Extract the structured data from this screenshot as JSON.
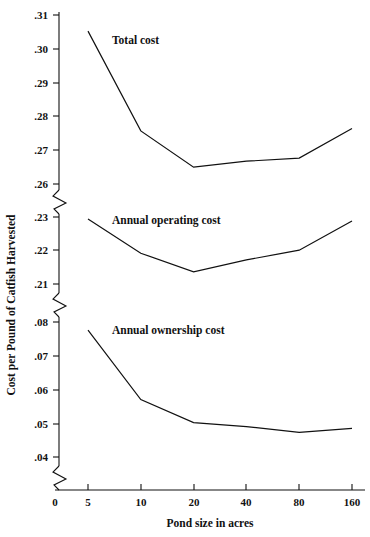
{
  "chart_data": {
    "type": "line",
    "title": "",
    "xlabel": "Pond size in acres",
    "ylabel": "Cost per Pound of Catfish Harvested",
    "x_scale": "log2",
    "x": [
      5,
      10,
      20,
      40,
      80,
      160
    ],
    "x_tick_labels": [
      "0",
      "5",
      "10",
      "20",
      "40",
      "80",
      "160"
    ],
    "y_tick_labels_upper": [
      ".31",
      ".30",
      ".29",
      ".28",
      ".27",
      ".26"
    ],
    "y_tick_labels_middle": [
      ".23",
      ".22",
      ".21"
    ],
    "y_tick_labels_lower": [
      ".08",
      ".07",
      ".06",
      ".05",
      ".04"
    ],
    "y_axis_breaks": 3,
    "grid": false,
    "legend": "inline-labels",
    "series": [
      {
        "name": "Total cost",
        "label": "Total cost",
        "values": [
          0.3055,
          0.2758,
          0.265,
          0.2668,
          0.2677,
          0.2765
        ]
      },
      {
        "name": "Annual operating cost",
        "label": "Annual operating cost",
        "values": [
          0.2294,
          0.2192,
          0.2136,
          0.2172,
          0.2201,
          0.2288
        ]
      },
      {
        "name": "Annual ownership cost",
        "label": "Annual ownership cost",
        "values": [
          0.0776,
          0.057,
          0.0502,
          0.049,
          0.0473,
          0.0485
        ]
      }
    ]
  },
  "axis": {
    "x_title": "Pond size in acres",
    "y_title": "Cost per Pound of Catfish Harvested"
  },
  "ticks": {
    "x": [
      {
        "label": "0",
        "px": 55
      },
      {
        "label": "5",
        "px": 88
      },
      {
        "label": "10",
        "px": 141
      },
      {
        "label": "20",
        "px": 194
      },
      {
        "label": "40",
        "px": 246
      },
      {
        "label": "80",
        "px": 299
      },
      {
        "label": "160",
        "px": 352
      }
    ],
    "y": [
      {
        "label": ".31",
        "px": 15
      },
      {
        "label": ".30",
        "px": 49
      },
      {
        "label": ".29",
        "px": 83
      },
      {
        "label": ".28",
        "px": 116
      },
      {
        "label": ".27",
        "px": 150
      },
      {
        "label": ".26",
        "px": 184
      },
      {
        "label": ".23",
        "px": 217
      },
      {
        "label": ".22",
        "px": 250
      },
      {
        "label": ".21",
        "px": 284
      },
      {
        "label": ".08",
        "px": 322
      },
      {
        "label": ".07",
        "px": 356
      },
      {
        "label": ".06",
        "px": 390
      },
      {
        "label": ".05",
        "px": 424
      },
      {
        "label": ".04",
        "px": 457
      }
    ]
  },
  "series_labels": [
    {
      "text": "Total cost",
      "x": 112,
      "y": 44
    },
    {
      "text": "Annual operating cost",
      "x": 112,
      "y": 224
    },
    {
      "text": "Annual ownership cost",
      "x": 112,
      "y": 334
    }
  ],
  "colors": {
    "line": "#111111",
    "axis": "#111111",
    "background": "#ffffff"
  }
}
